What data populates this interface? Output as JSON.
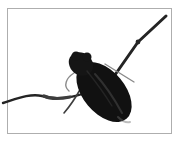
{
  "image": {
    "description": "Close-up photograph of a dark water bug with long slender angled legs, framed by a thin gray border on a white background",
    "subject": "insect",
    "colors": {
      "background": "#ffffff",
      "border": "#aeaeae",
      "body": "#111111",
      "head": "#151515",
      "leg_dark": "#242424",
      "leg_mid": "#3d3d3d",
      "leg_light": "#8a8a8a",
      "highlight": "#6a6a6a"
    }
  }
}
